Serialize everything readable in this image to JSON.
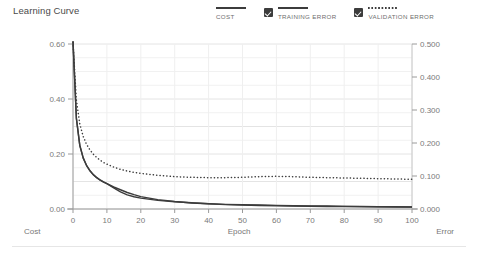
{
  "header": {
    "title": "Learning Curve"
  },
  "legend": {
    "items": [
      {
        "label": "COST",
        "style": "solid",
        "checkbox": false,
        "color": "#3c3c3c"
      },
      {
        "label": "TRAINING ERROR",
        "style": "solid",
        "checkbox": true,
        "color": "#3c3c3c"
      },
      {
        "label": "VALIDATION ERROR",
        "style": "dotted",
        "checkbox": true,
        "color": "#3c3c3c"
      }
    ]
  },
  "footer": {
    "left_label": "Cost",
    "center_label": "Epoch",
    "right_label": "Error"
  },
  "chart_data": {
    "type": "line",
    "title": "Learning Curve",
    "xlabel": "Epoch",
    "ylabel": "Cost",
    "y2label": "Error",
    "grid": true,
    "legend_position": "top-right",
    "xlim": [
      0,
      100
    ],
    "xticks": [
      0,
      10,
      20,
      30,
      40,
      50,
      60,
      70,
      80,
      90,
      100
    ],
    "xticklabels": [
      "0",
      "10",
      "20",
      "30",
      "40",
      "50",
      "60",
      "70",
      "80",
      "90",
      "100"
    ],
    "ylim": [
      0.0,
      0.6
    ],
    "yticks": [
      0.0,
      0.2,
      0.4,
      0.6
    ],
    "yticklabels": [
      "0.00",
      "0.20",
      "0.40",
      "0.60"
    ],
    "y2lim": [
      0.0,
      0.5
    ],
    "y2ticks": [
      0.0,
      0.1,
      0.2,
      0.3,
      0.4,
      0.5
    ],
    "y2ticklabels": [
      "0.000",
      "0.100",
      "0.200",
      "0.300",
      "0.400",
      "0.500"
    ],
    "x": [
      0,
      1,
      2,
      3,
      4,
      5,
      6,
      7,
      8,
      9,
      10,
      12,
      14,
      16,
      18,
      20,
      25,
      30,
      35,
      40,
      45,
      50,
      55,
      60,
      65,
      70,
      75,
      80,
      85,
      90,
      95,
      100
    ],
    "series": [
      {
        "name": "COST",
        "axis": "left",
        "style": "solid",
        "color": "#3c3c3c",
        "values": [
          0.61,
          0.33,
          0.232,
          0.186,
          0.158,
          0.139,
          0.125,
          0.114,
          0.105,
          0.098,
          0.092,
          0.08,
          0.07,
          0.06,
          0.052,
          0.045,
          0.034,
          0.027,
          0.022,
          0.019,
          0.016,
          0.014,
          0.013,
          0.012,
          0.011,
          0.01,
          0.009,
          0.009,
          0.008,
          0.008,
          0.007,
          0.007
        ]
      },
      {
        "name": "TRAINING ERROR",
        "axis": "right",
        "style": "solid",
        "color": "#3c3c3c",
        "values": [
          0.508,
          0.274,
          0.193,
          0.155,
          0.132,
          0.116,
          0.104,
          0.095,
          0.088,
          0.082,
          0.077,
          0.064,
          0.052,
          0.043,
          0.037,
          0.033,
          0.026,
          0.022,
          0.019,
          0.016,
          0.014,
          0.013,
          0.012,
          0.011,
          0.01,
          0.009,
          0.009,
          0.008,
          0.008,
          0.007,
          0.007,
          0.006
        ]
      },
      {
        "name": "VALIDATION ERROR",
        "axis": "right",
        "style": "dotted",
        "color": "#3c3c3c",
        "values": [
          0.505,
          0.33,
          0.258,
          0.22,
          0.196,
          0.179,
          0.166,
          0.156,
          0.148,
          0.141,
          0.136,
          0.127,
          0.12,
          0.115,
          0.111,
          0.108,
          0.102,
          0.098,
          0.096,
          0.095,
          0.095,
          0.096,
          0.098,
          0.099,
          0.098,
          0.096,
          0.095,
          0.094,
          0.093,
          0.092,
          0.091,
          0.09
        ]
      }
    ]
  }
}
